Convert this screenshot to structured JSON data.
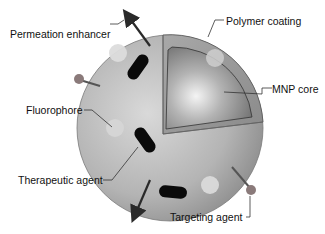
{
  "diagram": {
    "type": "labeled-illustration",
    "labels": {
      "permeation_enhancer": "Permeation enhancer",
      "polymer_coating": "Polymer coating",
      "mnp_core": "MNP core",
      "fluorophore": "Fluorophore",
      "therapeutic_agent": "Therapeutic agent",
      "targeting_agent": "Targeting agent"
    },
    "colors": {
      "background": "#ffffff",
      "shell_light": "#d8d8d8",
      "shell_dark": "#8f8f8f",
      "coating": "#9a9a9a",
      "core_light": "#f2f2f2",
      "core_dark": "#6e6e6e",
      "fluorophore": "#dcdcdc",
      "therapeutic": "#0a0a0a",
      "targeting_ball": "#8a7a7a",
      "arrow": "#2a2a2a",
      "leader_line": "#333333",
      "text": "#111111"
    }
  }
}
